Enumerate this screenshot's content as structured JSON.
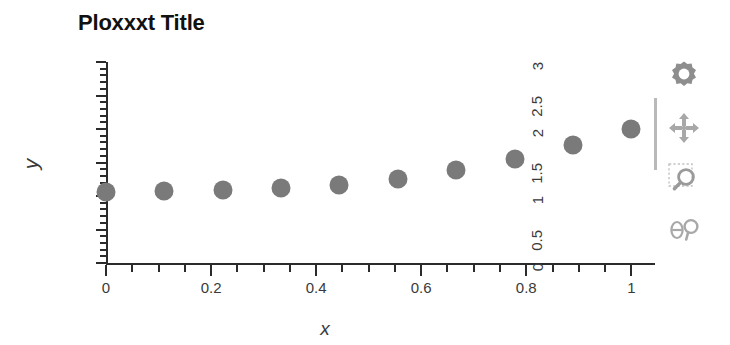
{
  "chart_data": {
    "type": "scatter",
    "title": "Ploxxxt Title",
    "xlabel": "x",
    "ylabel": "y",
    "xlim": [
      0,
      1.045
    ],
    "ylim": [
      0,
      3
    ],
    "grid": false,
    "legend": null,
    "marker_color": "#7a7a7a",
    "marker_shape": "circle",
    "x_ticks": [
      0,
      0.2,
      0.4,
      0.6,
      0.8,
      1
    ],
    "x_tick_labels": [
      "0",
      "0.2",
      "0.4",
      "0.6",
      "0.8",
      "1"
    ],
    "x_minor_step": 0.05,
    "y_ticks": [
      0,
      0.5,
      1,
      1.5,
      2,
      2.5,
      3
    ],
    "y_tick_labels": [
      "0",
      "0.5",
      "1",
      "1.5",
      "2",
      "2.5",
      "3"
    ],
    "y_minor_step": 0.1,
    "x": [
      0,
      0.111,
      0.222,
      0.333,
      0.444,
      0.556,
      0.667,
      0.778,
      0.889,
      1
    ],
    "y": [
      1.06,
      1.07,
      1.09,
      1.12,
      1.17,
      1.26,
      1.39,
      1.55,
      1.76,
      2.0
    ]
  },
  "toolbar": {
    "items": [
      {
        "name": "settings-gear-icon",
        "label": "Settings"
      },
      {
        "name": "pan-move-icon",
        "label": "Pan"
      },
      {
        "name": "zoom-box-icon",
        "label": "Zoom to rectangle"
      },
      {
        "name": "theta-probe-icon",
        "label": "Data probe"
      }
    ]
  }
}
